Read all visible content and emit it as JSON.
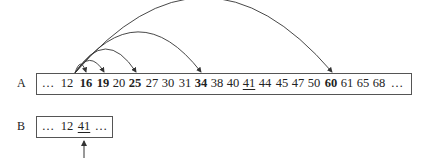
{
  "rows": {
    "a": {
      "label": "A",
      "cells": [
        {
          "text": "…",
          "x": 48,
          "style": ""
        },
        {
          "text": "12",
          "x": 67,
          "style": ""
        },
        {
          "text": "16",
          "x": 86,
          "style": "bold"
        },
        {
          "text": "19",
          "x": 103,
          "style": "bold"
        },
        {
          "text": "20",
          "x": 119,
          "style": ""
        },
        {
          "text": "25",
          "x": 135,
          "style": "bold"
        },
        {
          "text": "27",
          "x": 152,
          "style": ""
        },
        {
          "text": "30",
          "x": 168,
          "style": ""
        },
        {
          "text": "31",
          "x": 185,
          "style": ""
        },
        {
          "text": "34",
          "x": 201,
          "style": "bold"
        },
        {
          "text": "38",
          "x": 217,
          "style": ""
        },
        {
          "text": "40",
          "x": 233,
          "style": ""
        },
        {
          "text": "41",
          "x": 249,
          "style": "under"
        },
        {
          "text": "44",
          "x": 265,
          "style": ""
        },
        {
          "text": "45",
          "x": 282,
          "style": ""
        },
        {
          "text": "47",
          "x": 298,
          "style": ""
        },
        {
          "text": "50",
          "x": 314,
          "style": ""
        },
        {
          "text": "60",
          "x": 331,
          "style": "bold"
        },
        {
          "text": "61",
          "x": 347,
          "style": ""
        },
        {
          "text": "65",
          "x": 363,
          "style": ""
        },
        {
          "text": "68",
          "x": 379,
          "style": ""
        },
        {
          "text": "…",
          "x": 397,
          "style": ""
        }
      ]
    },
    "b": {
      "label": "B",
      "cells": [
        {
          "text": "…",
          "x": 48,
          "style": ""
        },
        {
          "text": "12",
          "x": 67,
          "style": ""
        },
        {
          "text": "41",
          "x": 84,
          "style": "under"
        },
        {
          "text": "…",
          "x": 101,
          "style": ""
        }
      ]
    }
  },
  "arcs": {
    "origin": {
      "x": 75,
      "y": 73
    },
    "targets": [
      {
        "to": "16",
        "x": 86,
        "peak": 64
      },
      {
        "to": "19",
        "x": 104,
        "peak": 60
      },
      {
        "to": "25",
        "x": 136,
        "peak": 48
      },
      {
        "to": "34",
        "x": 201,
        "peak": 30
      },
      {
        "to": "60",
        "x": 332,
        "peak": -6
      }
    ]
  },
  "pointer": {
    "x": 84,
    "y_from": 158,
    "y_to": 141
  },
  "colors": {
    "line": "#333333",
    "border": "#555555"
  }
}
